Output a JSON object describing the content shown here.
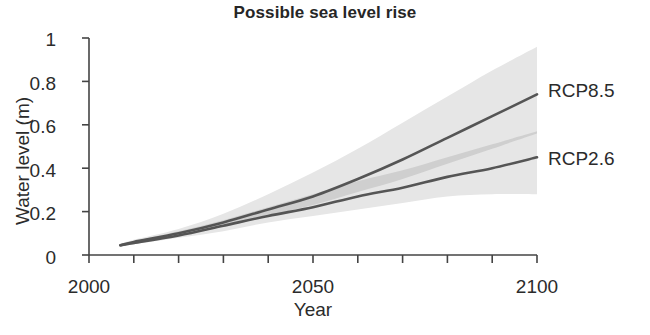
{
  "chart_data": {
    "type": "line",
    "title": "Possible sea level rise",
    "xlabel": "Year",
    "ylabel": "Water level (m)",
    "xlim": [
      2000,
      2100
    ],
    "ylim": [
      0,
      1
    ],
    "grid": false,
    "legend_position": "right-of-axes (inline series labels)",
    "xticks": [
      2000,
      2010,
      2020,
      2030,
      2040,
      2050,
      2060,
      2070,
      2080,
      2090,
      2100
    ],
    "xtick_labels": [
      "2000",
      "",
      "",
      "",
      "",
      "2050",
      "",
      "",
      "",
      "",
      "2100"
    ],
    "yticks": [
      0,
      0.2,
      0.4,
      0.6,
      0.8,
      1
    ],
    "ytick_labels": [
      "0",
      "0.2",
      "0.4",
      "0.6",
      "0.8",
      "1"
    ],
    "x": [
      2007,
      2010,
      2020,
      2030,
      2040,
      2050,
      2060,
      2070,
      2080,
      2090,
      2100
    ],
    "series": [
      {
        "name": "RCP8.5",
        "label": "RCP8.5",
        "color": "#555555",
        "values": [
          0.045,
          0.06,
          0.1,
          0.15,
          0.21,
          0.27,
          0.35,
          0.44,
          0.54,
          0.64,
          0.74
        ],
        "band_name": "RCP8.5 likely range",
        "band_color": "#e6e6e6",
        "band_upper": [
          0.05,
          0.07,
          0.12,
          0.19,
          0.28,
          0.38,
          0.49,
          0.61,
          0.73,
          0.85,
          0.96
        ],
        "band_lower": [
          0.04,
          0.05,
          0.09,
          0.13,
          0.18,
          0.23,
          0.29,
          0.35,
          0.42,
          0.49,
          0.56
        ]
      },
      {
        "name": "RCP2.6",
        "label": "RCP2.6",
        "color": "#555555",
        "values": [
          0.045,
          0.055,
          0.09,
          0.135,
          0.18,
          0.22,
          0.27,
          0.31,
          0.36,
          0.4,
          0.45
        ],
        "band_name": "RCP2.6 likely range",
        "band_color": "#e6e6e6",
        "band_upper": [
          0.05,
          0.065,
          0.11,
          0.16,
          0.22,
          0.28,
          0.34,
          0.39,
          0.45,
          0.51,
          0.57
        ],
        "band_lower": [
          0.04,
          0.05,
          0.08,
          0.11,
          0.15,
          0.18,
          0.21,
          0.24,
          0.27,
          0.28,
          0.28
        ]
      }
    ],
    "overlap_band": {
      "name": "band overlap",
      "color": "#cfcfcf",
      "upper": [
        0.05,
        0.065,
        0.11,
        0.16,
        0.22,
        0.28,
        0.34,
        0.39,
        0.45,
        0.51,
        0.57
      ],
      "lower": [
        0.04,
        0.05,
        0.09,
        0.13,
        0.18,
        0.23,
        0.29,
        0.35,
        0.42,
        0.49,
        0.56
      ]
    }
  },
  "axes": {
    "title": "Possible sea level rise",
    "x_axis_label": "Year",
    "y_axis_label": "Water level (m)",
    "y_tick_labels": [
      "1",
      "0.8",
      "0.6",
      "0.4",
      "0.2",
      "0"
    ],
    "x_tick_labels": [
      "2000",
      "2050",
      "2100"
    ]
  },
  "series_labels": {
    "upper": "RCP8.5",
    "lower": "RCP2.6"
  },
  "colors": {
    "axis": "#444444",
    "line": "#555555",
    "band": "#e6e6e6",
    "band_overlap": "#cfcfcf",
    "text": "#2b2b2b",
    "background": "#ffffff"
  }
}
